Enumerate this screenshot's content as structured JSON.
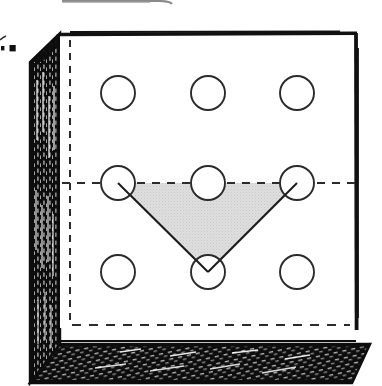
{
  "figure": {
    "caption_fragment": ".",
    "colors": {
      "ink": "#111111",
      "paper": "#ffffff",
      "triangle_fill": "#d9d9d9",
      "triangle_stroke": "#1a1a1a",
      "circle_stroke": "#2b2b2b",
      "hidden_edge": "#2b2b2b",
      "shadow_face": "#0d0d0d"
    },
    "front_face": {
      "label": "front-face",
      "x": 60,
      "y": 33,
      "width": 297,
      "height": 295
    },
    "left_face": {
      "label": "left-shaded-face",
      "hatch_direction": "vertical",
      "fill": "#0d0d0d"
    },
    "bottom_face": {
      "label": "bottom-shaded-face",
      "hatch_direction": "diagonal",
      "fill": "#0d0d0d"
    },
    "hidden_edges": {
      "vertical_x": 70,
      "horizontal_y": 325,
      "dash_pattern": "7 6"
    },
    "center_line": {
      "label": "horizontal-center-dashed-line",
      "y": 183,
      "x_start": 62,
      "x_end": 356,
      "dash_pattern": "8 7"
    },
    "grid": {
      "rows": 3,
      "cols": 3,
      "radius": 17,
      "col_x": [
        118,
        208,
        297
      ],
      "row_y": [
        93,
        183,
        272
      ],
      "circles": [
        {
          "name": "hole-top-left",
          "cx": 118,
          "cy": 93
        },
        {
          "name": "hole-top-center",
          "cx": 208,
          "cy": 93
        },
        {
          "name": "hole-top-right",
          "cx": 297,
          "cy": 93
        },
        {
          "name": "hole-middle-left",
          "cx": 118,
          "cy": 183
        },
        {
          "name": "hole-middle-center",
          "cx": 208,
          "cy": 183
        },
        {
          "name": "hole-middle-right",
          "cx": 297,
          "cy": 183
        },
        {
          "name": "hole-bottom-left",
          "cx": 118,
          "cy": 272
        },
        {
          "name": "hole-bottom-center",
          "cx": 208,
          "cy": 272
        },
        {
          "name": "hole-bottom-right",
          "cx": 297,
          "cy": 272
        }
      ]
    },
    "triangle": {
      "name": "shaded-triangle",
      "vertices": [
        {
          "label": "left-vertex",
          "x": 118,
          "y": 183
        },
        {
          "label": "right-vertex",
          "x": 297,
          "y": 183
        },
        {
          "label": "apex-vertex",
          "x": 208,
          "y": 272
        }
      ],
      "fill": "#d9d9d9",
      "stroke": "#1a1a1a"
    },
    "top_clipped_element": {
      "name": "clipped-rounded-rect-bottom-edge",
      "x_start": 62,
      "x_end": 170,
      "y": 3
    },
    "left_margin_marks": [
      {
        "name": "margin-mark-a",
        "x": 2,
        "y": 47,
        "w": 3,
        "h": 4
      },
      {
        "name": "margin-mark-b",
        "x": 10,
        "y": 46,
        "w": 6,
        "h": 6
      }
    ]
  }
}
